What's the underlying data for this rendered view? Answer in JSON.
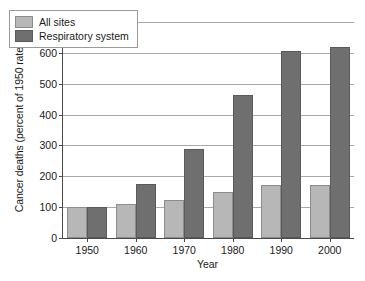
{
  "chart_data": {
    "type": "bar",
    "title": "",
    "xlabel": "Year",
    "ylabel": "Cancer deaths (percent of 1950 rate)",
    "categories": [
      "1950",
      "1960",
      "1970",
      "1980",
      "1990",
      "2000"
    ],
    "series": [
      {
        "name": "All sites",
        "color": "#b7b7b7",
        "values": [
          100,
          110,
          122,
          150,
          172,
          172
        ]
      },
      {
        "name": "Respiratory system",
        "color": "#6f6f6f",
        "values": [
          100,
          175,
          290,
          462,
          605,
          620
        ]
      }
    ],
    "ylim": [
      0,
      700
    ],
    "yticks": [
      0,
      100,
      200,
      300,
      400,
      500,
      600,
      700
    ],
    "ytick_labels": [
      "0",
      "100",
      "200",
      "300",
      "400",
      "500",
      "600",
      "700"
    ],
    "grid": true,
    "legend_position": "top-left"
  }
}
